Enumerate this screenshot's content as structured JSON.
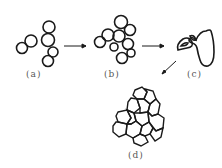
{
  "figure": {
    "stages": [
      {
        "id": "a",
        "label": "(a)",
        "description": "chain of separate grains/particles"
      },
      {
        "id": "b",
        "label": "(b)",
        "description": "grains clustering with contact necks"
      },
      {
        "id": "c",
        "label": "(c)",
        "description": "coalesced grain"
      },
      {
        "id": "d",
        "label": "(d)",
        "description": "dense polygonal grain aggregate"
      }
    ],
    "arrows": [
      {
        "from": "a",
        "to": "b"
      },
      {
        "from": "b",
        "to": "c"
      },
      {
        "from": "c",
        "to": "d"
      }
    ],
    "colors": {
      "stroke": "#1a1a1a",
      "label": "#555555",
      "background": "#ffffff"
    }
  }
}
